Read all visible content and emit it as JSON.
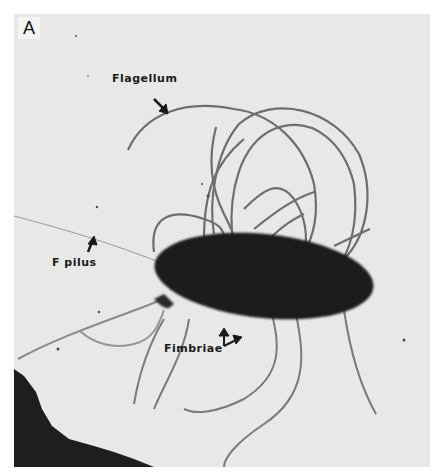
{
  "figure": {
    "panel_label": "A",
    "background_color": "#e6e6e4",
    "cell_color": "#1c1c1c",
    "labels": [
      {
        "text": "Flagellum"
      },
      {
        "text": "F pilus"
      },
      {
        "text": "Fimbriae"
      }
    ]
  }
}
